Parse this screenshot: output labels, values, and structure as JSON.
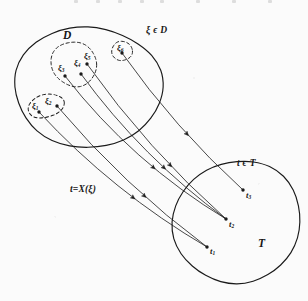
{
  "figure": {
    "kind": "set-mapping-diagram",
    "caption_labels": {
      "domain_set": "D",
      "codomain_set": "T",
      "domain_membership": "ξ ϵ D",
      "codomain_membership": "t ϵ T",
      "mapping": "t=X(ξ)"
    },
    "colors": {
      "ink": "#161616",
      "background": "#fbfbfb",
      "stroke": "#1a1a1a"
    },
    "domain_region": {
      "name": "D",
      "label": "D",
      "label_pos": [
        63,
        30
      ],
      "membership_label": "ξ ϵ D",
      "membership_label_pos": [
        146,
        26
      ],
      "outline": "solid",
      "center": [
        88,
        87
      ],
      "rx": 72,
      "ry": 62
    },
    "codomain_region": {
      "name": "T",
      "label": "T",
      "label_pos": [
        258,
        238
      ],
      "membership_label": "t ϵ T",
      "membership_label_pos": [
        237,
        159
      ],
      "outline": "solid",
      "center": [
        237,
        222
      ],
      "rx": 63,
      "ry": 62
    },
    "domain_subsets": [
      {
        "name": "subset-xi12",
        "outline": "dashed",
        "center": [
          46,
          106
        ],
        "rx": 19,
        "ry": 11,
        "rotate": -12
      },
      {
        "name": "subset-xi345",
        "outline": "dashed",
        "center": [
          74,
          64
        ],
        "rx": 23,
        "ry": 22,
        "rotate": 0
      },
      {
        "name": "subset-xi6",
        "outline": "dashed",
        "center": [
          122,
          51
        ],
        "rx": 10,
        "ry": 10,
        "rotate": 0
      }
    ],
    "domain_points": [
      {
        "id": "xi1",
        "label": "ξ",
        "sub": "1",
        "x": 39,
        "y": 112,
        "label_x": 32,
        "label_y": 102
      },
      {
        "id": "xi2",
        "label": "ξ",
        "sub": "2",
        "x": 57,
        "y": 106,
        "label_x": 45,
        "label_y": 97
      },
      {
        "id": "xi3",
        "label": "ξ",
        "sub": "3",
        "x": 65,
        "y": 76,
        "label_x": 58,
        "label_y": 64
      },
      {
        "id": "xi4",
        "label": "ξ",
        "sub": "4",
        "x": 81,
        "y": 74,
        "label_x": 74,
        "label_y": 59
      },
      {
        "id": "xi5",
        "label": "ξ",
        "sub": "5",
        "x": 87,
        "y": 64,
        "label_x": 84,
        "label_y": 52
      },
      {
        "id": "xi6",
        "label": "ξ",
        "sub": "6",
        "x": 122,
        "y": 53,
        "label_x": 117,
        "label_y": 44
      }
    ],
    "codomain_points": [
      {
        "id": "t1",
        "label": "t",
        "sub": "1",
        "x": 207,
        "y": 247,
        "label_x": 210,
        "label_y": 247
      },
      {
        "id": "t2",
        "label": "t",
        "sub": "2",
        "x": 226,
        "y": 219,
        "label_x": 229,
        "label_y": 220
      },
      {
        "id": "t3",
        "label": "t",
        "sub": "3",
        "x": 243,
        "y": 190,
        "label_x": 246,
        "label_y": 191
      }
    ],
    "mapping_label": {
      "text": "t=X(ξ)",
      "x": 70,
      "y": 185
    },
    "arrows": [
      {
        "id": "arrow-xi1-t1",
        "from": "xi1",
        "to": "t1",
        "bend": 16,
        "marker_at": 0.6
      },
      {
        "id": "arrow-xi2-t1",
        "from": "xi2",
        "to": "t1",
        "bend": 12,
        "marker_at": 0.62
      },
      {
        "id": "arrow-xi3-t2",
        "from": "xi3",
        "to": "t2",
        "bend": 20,
        "marker_at": 0.6
      },
      {
        "id": "arrow-xi4-t2",
        "from": "xi4",
        "to": "t2",
        "bend": 16,
        "marker_at": 0.62
      },
      {
        "id": "arrow-xi5-t2",
        "from": "xi5",
        "to": "t2",
        "bend": 12,
        "marker_at": 0.64
      },
      {
        "id": "arrow-xi6-t3",
        "from": "xi6",
        "to": "t3",
        "bend": 10,
        "marker_at": 0.58
      }
    ],
    "scan_ticks": [
      74,
      96,
      118,
      140,
      160,
      196,
      232,
      268
    ]
  }
}
